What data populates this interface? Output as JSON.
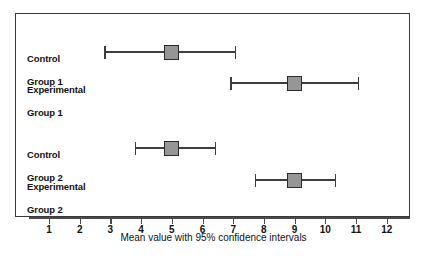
{
  "chart_data": {
    "type": "scatter",
    "title": "",
    "xlabel": "Mean value with 95% confidence intervals",
    "ylabel": "",
    "xlim": [
      0.35,
      12.75
    ],
    "xticks": [
      1,
      2,
      3,
      4,
      5,
      6,
      7,
      8,
      9,
      10,
      11,
      12
    ],
    "xticklabels": [
      "1",
      "2",
      "3",
      "4",
      "5",
      "6",
      "7",
      "8",
      "9",
      "10",
      "11",
      "12"
    ],
    "grid": false,
    "legend": null,
    "categories": [
      "Control Group 1",
      "Experimental Group 1",
      "Control Group 2",
      "Experimental Group 2"
    ],
    "series": [
      {
        "name": "Mean with 95% CI",
        "points": [
          {
            "label": "Control Group 1",
            "mean": 5.0,
            "ci_low": 2.8,
            "ci_high": 7.05
          },
          {
            "label": "Experimental Group 1",
            "mean": 9.0,
            "ci_low": 6.9,
            "ci_high": 11.05
          },
          {
            "label": "Control Group 2",
            "mean": 5.0,
            "ci_low": 3.8,
            "ci_high": 6.4
          },
          {
            "label": "Experimental Group 2",
            "mean": 9.0,
            "ci_low": 7.7,
            "ci_high": 10.3
          }
        ]
      }
    ],
    "colors": {
      "marker_fill": "#969696",
      "marker_edge": "#2b2b2b",
      "line": "#3d3d3d",
      "frame": "#3a3a3a",
      "text": "#111111"
    }
  },
  "labels": {
    "row1_line1": "Control",
    "row1_line2": "Group 1",
    "row2_line1": "Experimental",
    "row2_line2": "Group 1",
    "row3_line1": "Control",
    "row3_line2": "Group 2",
    "row4_line1": "Experimental",
    "row4_line2": "Group 2"
  },
  "axis": {
    "title": "Mean value with 95% confidence intervals",
    "tick_1": "1",
    "tick_2": "2",
    "tick_3": "3",
    "tick_4": "4",
    "tick_5": "5",
    "tick_6": "6",
    "tick_7": "7",
    "tick_8": "8",
    "tick_9": "9",
    "tick_10": "10",
    "tick_11": "11",
    "tick_12": "12"
  }
}
